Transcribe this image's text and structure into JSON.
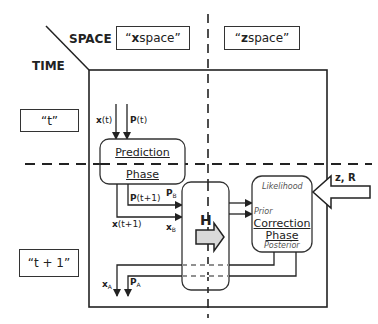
{
  "headers": {
    "space": "SPACE",
    "time": "TIME"
  },
  "space_labels": {
    "x_space_var": "x",
    "x_space_rest": " space",
    "z_space_var": "z",
    "z_space_rest": " space",
    "open_quote": "“",
    "close_quote": "”"
  },
  "time_labels": {
    "t": "“t”",
    "t_plus_1": "“t + 1”"
  },
  "prediction": {
    "line1": "Prediction",
    "line2": "Phase",
    "inputs": {
      "x_var": "x",
      "x_arg": "(t)",
      "p_var": "P",
      "p_arg": "(t)"
    },
    "outputs": {
      "p_var": "P",
      "p_arg": "(t+1)",
      "x_var": "x",
      "x_arg": "(t+1)"
    }
  },
  "background": {
    "p_var": "P",
    "p_sub": "B",
    "x_var": "x",
    "x_sub": "B"
  },
  "observation_operator": {
    "label": "H"
  },
  "correction": {
    "line1": "Correction",
    "line2": "Phase",
    "likelihood": "Likelihood",
    "prior": "Prior",
    "posterior": "Posterior"
  },
  "observations": {
    "label": "z, R"
  },
  "analysis": {
    "x_var": "x",
    "x_sub": "A",
    "p_var": "P",
    "p_sub": "A"
  },
  "colors": {
    "line": "#222222",
    "arrow_fill": "#d9d9d9",
    "box_border": "#333333"
  }
}
